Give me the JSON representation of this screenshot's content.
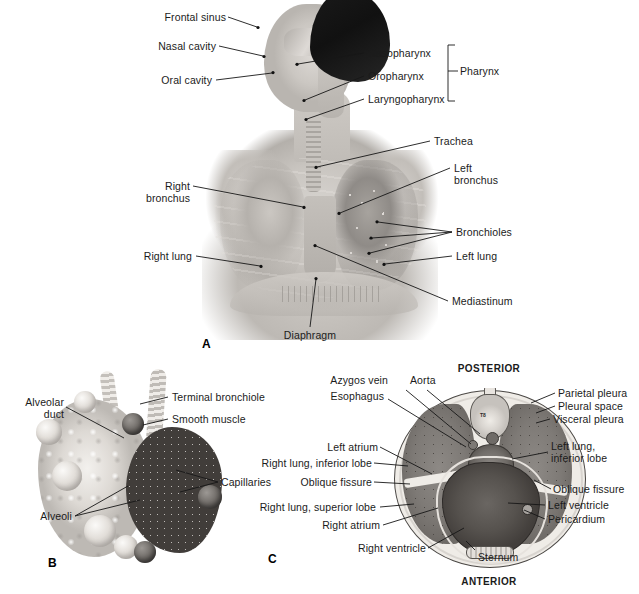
{
  "figure": {
    "background": "#ffffff",
    "panels": [
      "A",
      "B",
      "C"
    ]
  },
  "panel_a": {
    "letter": "A",
    "labels": {
      "frontal_sinus": "Frontal sinus",
      "nasal_cavity": "Nasal cavity",
      "oral_cavity": "Oral cavity",
      "nasopharynx": "Nasopharynx",
      "oropharynx": "Oropharynx",
      "laryngopharynx": "Laryngopharynx",
      "pharynx": "Pharynx",
      "trachea": "Trachea",
      "left_bronchus_line1": "Left",
      "left_bronchus_line2": "bronchus",
      "right_bronchus_line1": "Right",
      "right_bronchus_line2": "bronchus",
      "bronchioles": "Bronchioles",
      "right_lung": "Right lung",
      "left_lung": "Left lung",
      "mediastinum": "Mediastinum",
      "diaphragm": "Diaphragm"
    }
  },
  "panel_b": {
    "letter": "B",
    "labels": {
      "terminal_bronchiole": "Terminal bronchiole",
      "smooth_muscle": "Smooth muscle",
      "alveolar_duct_line1": "Alveolar",
      "alveolar_duct_line2": "duct",
      "capillaries": "Capillaries",
      "alveoli": "Alveoli"
    }
  },
  "panel_c": {
    "letter": "C",
    "labels": {
      "posterior": "POSTERIOR",
      "anterior": "ANTERIOR",
      "azygos_vein": "Azygos vein",
      "aorta": "Aorta",
      "esophagus": "Esophagus",
      "left_atrium": "Left atrium",
      "right_lung_inferior_lobe": "Right lung, inferior lobe",
      "oblique_fissure_left": "Oblique fissure",
      "right_lung_superior_lobe": "Right lung, superior lobe",
      "right_atrium": "Right atrium",
      "right_ventricle": "Right ventricle",
      "sternum": "Sternum",
      "parietal_pleura": "Parietal pleura",
      "pleural_space": "Pleural space",
      "visceral_pleura": "Visceral pleura",
      "left_lung_line1": "Left lung,",
      "left_lung_line2": "inferior lobe",
      "oblique_fissure_right": "Oblique fissure",
      "left_ventricle": "Left ventricle",
      "pericardium": "Pericardium",
      "vertebra_marker": "T8"
    }
  },
  "colors": {
    "text": "#1b1b1b",
    "leader_line": "#161616",
    "page_background": "#ffffff",
    "lung_tissue": "#7e7a76",
    "heart_tissue": "#56524e",
    "pleura_light": "#efece7"
  }
}
